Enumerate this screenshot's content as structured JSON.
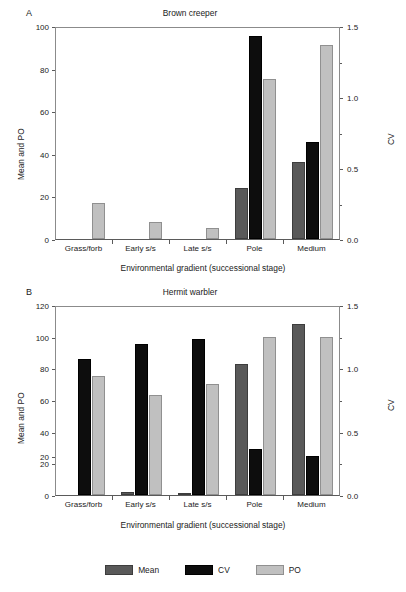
{
  "figure": {
    "xlabel": "Environmental gradient (successional stage)",
    "ylabel_left": "Mean and PO",
    "ylabel_right": "CV",
    "legend": [
      {
        "key": "mean",
        "label": "Mean",
        "color": "#595959"
      },
      {
        "key": "cv",
        "label": "CV",
        "color": "#0d0d0d"
      },
      {
        "key": "po",
        "label": "PO",
        "color": "#c0c0c0"
      }
    ]
  },
  "panelA": {
    "letter": "A",
    "title": "Brown creeper",
    "yticks_left": [
      "0",
      "20",
      "40",
      "60",
      "80",
      "100"
    ],
    "yticks_right": [
      "0.0",
      "0.5",
      "1.0",
      "1.5"
    ],
    "categories": [
      "Grass/forb",
      "Early s/s",
      "Late s/s",
      "Pole",
      "Medium"
    ]
  },
  "panelB": {
    "letter": "B",
    "title": "Hermit warbler",
    "yticks_left": [
      "0",
      "20",
      "20",
      "40",
      "60",
      "80",
      "100",
      "120"
    ],
    "yticks_right": [
      "0.0",
      "0.5",
      "1.0",
      "1.5"
    ],
    "categories": [
      "Grass/forb",
      "Early s/s",
      "Late s/s",
      "Pole",
      "Medium"
    ]
  },
  "chart_data": [
    {
      "type": "bar",
      "panel": "A",
      "title": "Brown creeper",
      "xlabel": "Environmental gradient (successional stage)",
      "ylabel": "Mean and PO",
      "ylabel_secondary": "CV",
      "categories": [
        "Grass/forb",
        "Early s/s",
        "Late s/s",
        "Pole",
        "Medium"
      ],
      "ylim": [
        0,
        100
      ],
      "ylim_secondary": [
        0.0,
        1.5
      ],
      "yticks": [
        0,
        20,
        40,
        60,
        80,
        100
      ],
      "yticks_secondary": [
        0.0,
        0.5,
        1.0,
        1.5
      ],
      "grid": false,
      "legend_position": "bottom",
      "series": [
        {
          "name": "Mean",
          "axis": "left",
          "color": "#595959",
          "values": [
            0,
            0,
            0,
            24,
            36
          ]
        },
        {
          "name": "CV",
          "axis": "right",
          "color": "#0d0d0d",
          "values": [
            0,
            0,
            0,
            1.43,
            0.68
          ]
        },
        {
          "name": "PO",
          "axis": "left",
          "color": "#c0c0c0",
          "values": [
            17,
            8,
            5,
            75,
            91
          ]
        }
      ]
    },
    {
      "type": "bar",
      "panel": "B",
      "title": "Hermit warbler",
      "xlabel": "Environmental gradient (successional stage)",
      "ylabel": "Mean and PO",
      "ylabel_secondary": "CV",
      "categories": [
        "Grass/forb",
        "Early s/s",
        "Late s/s",
        "Pole",
        "Medium"
      ],
      "ylim": [
        0,
        120
      ],
      "ylim_secondary": [
        0.0,
        1.5
      ],
      "yticks": [
        0,
        20,
        40,
        60,
        80,
        100,
        120
      ],
      "yticks_secondary": [
        0.0,
        0.5,
        1.0,
        1.5
      ],
      "grid": false,
      "legend_position": "bottom",
      "series": [
        {
          "name": "Mean",
          "axis": "left",
          "color": "#595959",
          "values": [
            0,
            2,
            1,
            83,
            108
          ]
        },
        {
          "name": "CV",
          "axis": "right",
          "color": "#0d0d0d",
          "values": [
            1.07,
            1.19,
            1.23,
            0.36,
            0.31
          ]
        },
        {
          "name": "PO",
          "axis": "left",
          "color": "#c0c0c0",
          "values": [
            75,
            63,
            70,
            100,
            100
          ]
        }
      ]
    }
  ]
}
